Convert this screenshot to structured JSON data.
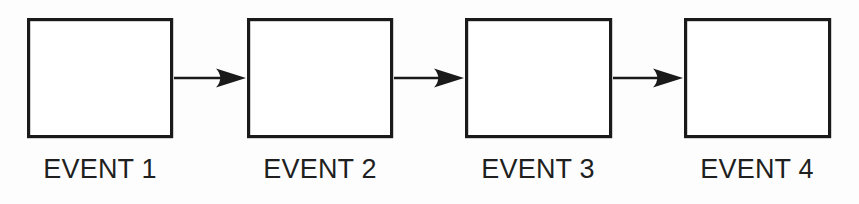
{
  "diagram": {
    "type": "linear-sequence-flowchart",
    "background_color": "#fdfdfd",
    "stroke_color": "#1a1a1a",
    "box_fill_color": "#ffffff",
    "label_color": "#1f1f1f",
    "nodes": [
      {
        "id": "event-1",
        "label": "EVENT 1",
        "x": 27,
        "y": 18,
        "width": 146,
        "height": 120,
        "label_center_x": 100,
        "label_baseline_y": 178
      },
      {
        "id": "event-2",
        "label": "EVENT 2",
        "x": 247,
        "y": 18,
        "width": 146,
        "height": 120,
        "label_center_x": 320,
        "label_baseline_y": 178
      },
      {
        "id": "event-3",
        "label": "EVENT 3",
        "x": 465,
        "y": 18,
        "width": 147,
        "height": 120,
        "label_center_x": 538,
        "label_baseline_y": 178
      },
      {
        "id": "event-4",
        "label": "EVENT 4",
        "x": 684,
        "y": 18,
        "width": 147,
        "height": 120,
        "label_center_x": 757,
        "label_baseline_y": 178
      }
    ],
    "connectors": [
      {
        "id": "arrow-1-to-2",
        "from": "event-1",
        "to": "event-2",
        "icon": "arrow-right-icon",
        "x1": 174,
        "x2": 246,
        "y": 78
      },
      {
        "id": "arrow-2-to-3",
        "from": "event-2",
        "to": "event-3",
        "icon": "arrow-right-icon",
        "x1": 394,
        "x2": 464,
        "y": 78
      },
      {
        "id": "arrow-3-to-4",
        "from": "event-3",
        "to": "event-4",
        "icon": "arrow-right-icon",
        "x1": 613,
        "x2": 683,
        "y": 78
      }
    ]
  }
}
